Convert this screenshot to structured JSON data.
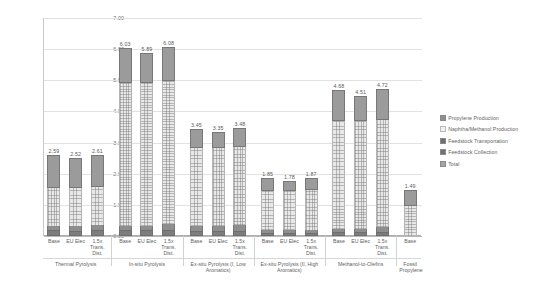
{
  "chart_data": {
    "type": "bar",
    "title": "",
    "xlabel": "",
    "ylabel": "GHG (kg CO2 -eq/kg propylene)",
    "ylim": [
      0.0,
      7.0
    ],
    "ytick_labels": [
      "7.00",
      "6.00",
      "5.00",
      "4.00",
      "3.00",
      "2.00",
      "1.00",
      "0.00"
    ],
    "ytick_values": [
      7.0,
      6.0,
      5.0,
      4.0,
      3.0,
      2.0,
      1.0,
      0.0
    ],
    "grid": true,
    "legend_position": "right",
    "stacked": true,
    "categories": [
      "Base",
      "EU Elec",
      "1.5x Trans. Dist.",
      "Base",
      "EU Elec",
      "1.5x Trans. Dist.",
      "Base",
      "EU Elec",
      "1.5x Trans. Dist.",
      "Base",
      "EU Elec",
      "1.5x Trans. Dist.",
      "Base",
      "EU Elec",
      "1.5x Trans. Dist.",
      "Base"
    ],
    "groups": [
      {
        "label": "Thermal Pyrolysis",
        "count": 3
      },
      {
        "label": "In-situ Pyrolysis",
        "count": 3
      },
      {
        "label": "Ex-situ Pyrolysis (I, Low Aromatics)",
        "count": 3
      },
      {
        "label": "Ex-situ Pyrolysis (II, High Aromatics)",
        "count": 3
      },
      {
        "label": "Methanol-to-Olefins",
        "count": 3
      },
      {
        "label": "Fossil Propylene",
        "count": 1
      }
    ],
    "series": [
      {
        "name": "Propylene Production",
        "values": [
          1.05,
          0.98,
          1.05,
          1.1,
          0.96,
          1.1,
          0.62,
          0.52,
          0.62,
          0.4,
          0.33,
          0.4,
          1.0,
          0.83,
          1.0,
          0.52
        ]
      },
      {
        "name": "Naphtha/Methanol Production",
        "values": [
          1.22,
          1.23,
          1.22,
          4.6,
          4.6,
          4.6,
          2.52,
          2.52,
          2.52,
          1.27,
          1.27,
          1.27,
          3.44,
          3.44,
          3.44,
          0.97
        ]
      },
      {
        "name": "Feedstock Transportation",
        "values": [
          0.14,
          0.14,
          0.16,
          0.15,
          0.15,
          0.2,
          0.15,
          0.15,
          0.18,
          0.08,
          0.08,
          0.1,
          0.11,
          0.11,
          0.15,
          0.0
        ]
      },
      {
        "name": "Feedstock Collection",
        "values": [
          0.18,
          0.17,
          0.18,
          0.18,
          0.18,
          0.18,
          0.16,
          0.16,
          0.16,
          0.1,
          0.1,
          0.1,
          0.13,
          0.13,
          0.13,
          0.0
        ]
      }
    ],
    "totals": [
      2.59,
      2.52,
      2.61,
      6.03,
      5.89,
      6.08,
      3.45,
      3.35,
      3.48,
      1.85,
      1.78,
      1.87,
      4.68,
      4.51,
      4.72,
      1.49
    ],
    "total_labels": [
      "2.59",
      "2.52",
      "2.61",
      "6.03",
      "5.89",
      "6.08",
      "3.45",
      "3.35",
      "3.48",
      "1.85",
      "1.78",
      "1.87",
      "4.68",
      "4.51",
      "4.72",
      "1.49"
    ],
    "legend": [
      "Propylene Production",
      "Naphtha/Methanol Production",
      "Feedstock Transportation",
      "Feedstock Collection",
      "Total"
    ],
    "colors": {
      "propylene": "#9b9b9b",
      "naphtha": "#e8e8e8",
      "transport": "#8e8e8e",
      "collection": "#7d7d7d",
      "total": "#a5a5a5",
      "grid": "#e2e2e2",
      "axis": "#b0b0b0",
      "text": "#5f5f5f"
    }
  }
}
